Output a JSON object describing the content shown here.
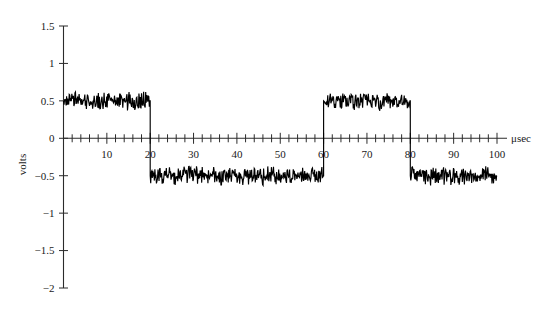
{
  "chart_data": {
    "type": "line",
    "title": "",
    "subtitle": "",
    "xlabel": "μsec",
    "ylabel": "volts",
    "xlim": [
      0,
      100
    ],
    "ylim": [
      -2,
      1.5
    ],
    "grid": false,
    "legend": false,
    "x_ticks_major": [
      10,
      20,
      30,
      40,
      50,
      60,
      70,
      80,
      90,
      100
    ],
    "x_tick_labels": [
      "10",
      "20",
      "30",
      "40",
      "50",
      "60",
      "70",
      "80",
      "90",
      "100"
    ],
    "x_minor_tick_step": 2,
    "y_ticks": [
      1.5,
      1,
      0.5,
      0,
      -0.5,
      -1,
      -1.5,
      -2
    ],
    "y_tick_labels": [
      "1.5",
      "1",
      "0.5",
      "0",
      "−0.5",
      "−1",
      "−1.5",
      "−2"
    ],
    "series": [
      {
        "name": "noisy bipolar signal",
        "color": "#000000",
        "description": "Noisy square-wave bit stream: HIGH +0.5 V on 0-20 and 60-80 μsec, LOW -0.5 V on 20-60 and 80-100 μsec",
        "levels": [
          {
            "x_start": 0,
            "x_end": 20,
            "value": 0.5,
            "noise_amplitude": 0.12
          },
          {
            "x_start": 20,
            "x_end": 60,
            "value": -0.5,
            "noise_amplitude": 0.12
          },
          {
            "x_start": 60,
            "x_end": 80,
            "value": 0.5,
            "noise_amplitude": 0.12
          },
          {
            "x_start": 80,
            "x_end": 100,
            "value": -0.5,
            "noise_amplitude": 0.12
          }
        ],
        "transitions": [
          20,
          60,
          80
        ],
        "sample_step": 0.12
      }
    ]
  },
  "axes": {
    "x_axis_label": "μsec",
    "y_axis_label": "volts"
  }
}
